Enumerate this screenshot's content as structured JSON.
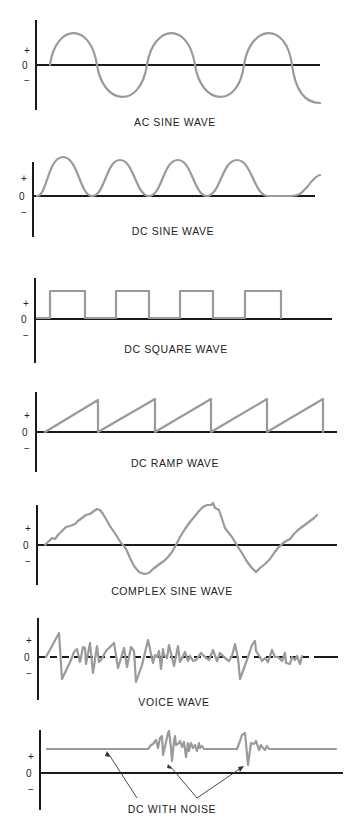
{
  "figure": {
    "colors": {
      "axis": "#1a1a1a",
      "wave": "#9a9a9a",
      "background": "#ffffff"
    },
    "axis_labels": {
      "plus": "+",
      "zero": "0",
      "minus": "−"
    },
    "panels": [
      {
        "id": "ac-sine",
        "caption": "AC SINE WAVE"
      },
      {
        "id": "dc-sine",
        "caption": "DC SINE WAVE"
      },
      {
        "id": "dc-square",
        "caption": "DC SQUARE WAVE"
      },
      {
        "id": "dc-ramp",
        "caption": "DC RAMP WAVE"
      },
      {
        "id": "complex-sine",
        "caption": "COMPLEX SINE WAVE"
      },
      {
        "id": "voice",
        "caption": "VOICE WAVE"
      },
      {
        "id": "dc-noise",
        "caption": "DC WITH NOISE"
      }
    ]
  }
}
